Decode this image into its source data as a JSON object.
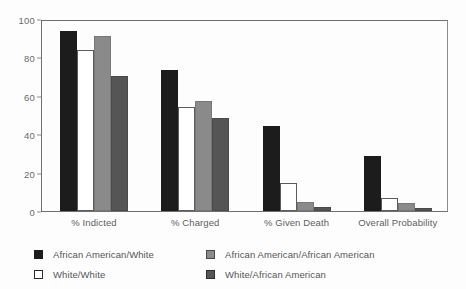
{
  "chart_data": {
    "type": "bar",
    "title": "",
    "subtitle": "",
    "xlabel": "",
    "ylabel": "",
    "ylim": [
      0,
      100
    ],
    "yticks": [
      0,
      20,
      40,
      60,
      80,
      100
    ],
    "ytick_labels": [
      "0",
      "20",
      "40",
      "60",
      "80",
      "100"
    ],
    "grid": false,
    "legend_position": "bottom",
    "categories": [
      "% Indicted",
      "% Charged",
      "% Given Death",
      "Overall Probability"
    ],
    "series": [
      {
        "name": "African American/White",
        "color": "#1c1c1c",
        "values": [
          95,
          74,
          45,
          29
        ]
      },
      {
        "name": "White/White",
        "color": "#ffffff",
        "values": [
          85,
          55,
          15,
          7
        ]
      },
      {
        "name": "African American/African American",
        "color": "#8a8a8a",
        "values": [
          92,
          58,
          5,
          4
        ]
      },
      {
        "name": "White/African American",
        "color": "#555555",
        "values": [
          71,
          49,
          2,
          1.5
        ]
      }
    ]
  },
  "legend": {
    "items": [
      {
        "label": "African American/White",
        "swatch": "black-swatch-icon",
        "column": "left",
        "row": 0
      },
      {
        "label": "White/White",
        "swatch": "white-swatch-icon",
        "column": "left",
        "row": 1
      },
      {
        "label": "African American/African American",
        "swatch": "light-gray-swatch-icon",
        "column": "right",
        "row": 0
      },
      {
        "label": "White/African American",
        "swatch": "dark-gray-swatch-icon",
        "column": "right",
        "row": 1
      }
    ]
  },
  "colors": {
    "series_black": "#1c1c1c",
    "series_white": "#ffffff",
    "series_light_gray": "#8a8a8a",
    "series_dark_gray": "#555555",
    "axis": "#6f6f6f",
    "text": "#5e5e5e",
    "background": "#fdfdfd"
  }
}
